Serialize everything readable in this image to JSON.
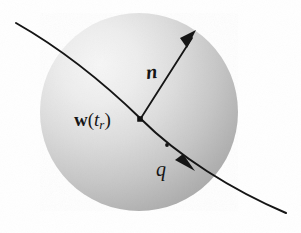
{
  "figure": {
    "background_color": "#fdfdfd",
    "ink_color": "#151515",
    "sphere": {
      "name": "shaded-sphere",
      "center_x": 139,
      "center_y": 112,
      "radius": 99,
      "fill_light": "#f2f2f2",
      "fill_mid": "#c9c9c9",
      "fill_dark": "#a6a6a6",
      "highlight_x": 95,
      "highlight_y": 72
    },
    "trajectory": {
      "name": "trajectory-curve",
      "start": [
        16,
        23
      ],
      "end": [
        286,
        213
      ],
      "stroke": "#151515",
      "stroke_width": 2.0
    },
    "vector_n": {
      "name": "vector-n",
      "tail": [
        140,
        119
      ],
      "tip": [
        196,
        31
      ],
      "stroke": "#151515",
      "stroke_width": 1.8
    },
    "retarded_point": {
      "name": "retarded-position-dot",
      "x": 140,
      "y": 119,
      "size": 5
    },
    "velocity_arrowhead": {
      "name": "velocity-arrowhead",
      "x": 189,
      "y": 164,
      "angle_deg": 41
    },
    "curve_tick": {
      "name": "trajectory-tick-dot",
      "x": 167,
      "y": 145,
      "size": 3.4
    }
  },
  "labels": {
    "w_vector": "w",
    "w_open_paren": "(",
    "w_var_t": "t",
    "w_sub_r": "r",
    "w_close_paren": ")",
    "n_vector": "n",
    "q_charge": "q"
  }
}
